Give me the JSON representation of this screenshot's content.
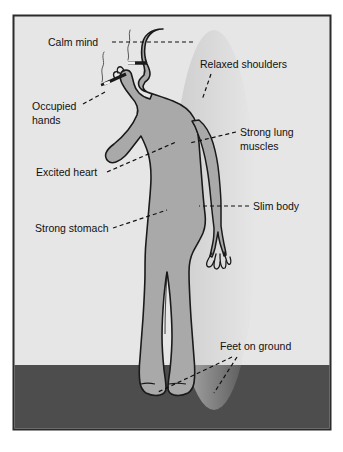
{
  "figure": {
    "title_visible": false,
    "type": "annotated-illustration",
    "colors": {
      "page_background": "#ffffff",
      "panel_background": "#e6e6e6",
      "ground": "#4d4d4d",
      "body_fill": "#a9a9a9",
      "outline": "#1a1a1a",
      "label_text": "#111111",
      "frame_border": "#2b2b2b"
    }
  },
  "panel": {
    "border_label": "illustration-frame",
    "ground_label": "ground-band"
  },
  "labels": [
    {
      "id": "calm-mind",
      "text": "Calm mind",
      "lines": [
        "Calm mind"
      ],
      "x": 48,
      "y": 46,
      "anchor": "start"
    },
    {
      "id": "relaxed-shoulders",
      "text": "Relaxed shoulders",
      "lines": [
        "Relaxed shoulders"
      ],
      "x": 200,
      "y": 68,
      "anchor": "start"
    },
    {
      "id": "occupied-hands",
      "text": "Occupied hands",
      "lines": [
        "Occupied",
        "hands"
      ],
      "x": 32,
      "y": 110,
      "anchor": "start"
    },
    {
      "id": "strong-lung-muscles",
      "text": "Strong lung muscles",
      "lines": [
        "Strong lung",
        "muscles"
      ],
      "x": 240,
      "y": 136,
      "anchor": "start"
    },
    {
      "id": "excited-heart",
      "text": "Excited heart",
      "lines": [
        "Excited heart"
      ],
      "x": 36,
      "y": 174,
      "anchor": "start"
    },
    {
      "id": "slim-body",
      "text": "Slim body",
      "lines": [
        "Slim body"
      ],
      "x": 253,
      "y": 208,
      "anchor": "start"
    },
    {
      "id": "strong-stomach",
      "text": "Strong stomach",
      "lines": [
        "Strong stomach"
      ],
      "x": 35,
      "y": 231,
      "anchor": "start"
    },
    {
      "id": "feet-on-ground",
      "text": "Feet on ground",
      "lines": [
        "Feet on ground"
      ],
      "x": 220,
      "y": 348,
      "anchor": "start"
    }
  ],
  "leader_lines": [
    {
      "id": "leader-calm-mind",
      "points": "112,42 196,42"
    },
    {
      "id": "leader-relaxed-shoulders",
      "points": "211,74 202,99"
    },
    {
      "id": "leader-occupied-hands",
      "points": "83,104 106,92"
    },
    {
      "id": "leader-strong-lung",
      "points": "236,132 192,142"
    },
    {
      "id": "leader-excited-heart",
      "points": "106,172 174,143"
    },
    {
      "id": "leader-slim-body",
      "points": "249,206 200,206"
    },
    {
      "id": "leader-strong-stomach",
      "points": "112,228 166,211"
    },
    {
      "id": "leader-feet-left",
      "points": "232,356 159,392"
    },
    {
      "id": "leader-feet-right",
      "points": "236,356 213,393"
    }
  ]
}
